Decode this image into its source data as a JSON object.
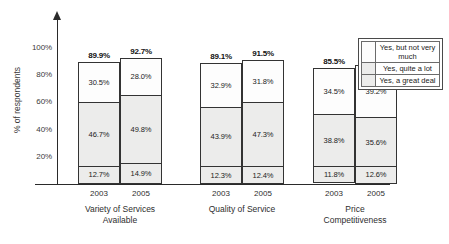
{
  "chart_data": {
    "type": "bar",
    "subtype": "stacked-grouped-column",
    "title": "",
    "xlabel": "",
    "ylabel": "% of respondents",
    "ylim": [
      0,
      100
    ],
    "yticks": [
      "20%",
      "40%",
      "60%",
      "80%",
      "100%"
    ],
    "ytick_values": [
      20,
      40,
      60,
      80,
      100
    ],
    "grid": false,
    "legend_position": "right",
    "legend": [
      {
        "name": "Yes, but not very much",
        "swatch": "#fdfdfd"
      },
      {
        "name": "Yes, quite a lot",
        "swatch": "#ececeb"
      },
      {
        "name": "Yes, a great deal",
        "swatch": "#ececeb"
      }
    ],
    "series": [
      {
        "name": "Yes, but not very much",
        "values": [
          30.5,
          28.0,
          32.9,
          31.8,
          34.5,
          39.2
        ]
      },
      {
        "name": "Yes, quite a lot",
        "values": [
          46.7,
          49.8,
          43.9,
          47.3,
          38.8,
          35.6
        ]
      },
      {
        "name": "Yes, a great deal",
        "values": [
          12.7,
          14.9,
          12.3,
          12.4,
          11.8,
          12.6
        ]
      }
    ],
    "categories": [
      "2003",
      "2005",
      "2003",
      "2005",
      "2003",
      "2005"
    ],
    "groups": [
      {
        "label": "Variety of Services Available",
        "label_line1": "Variety of Services",
        "label_line2": "Available",
        "bars": [
          {
            "year": "2003",
            "total": "89.9%",
            "total_value": 89.9,
            "segments": [
              {
                "label": "30.5%",
                "value": 30.5
              },
              {
                "label": "46.7%",
                "value": 46.7
              },
              {
                "label": "12.7%",
                "value": 12.7
              }
            ]
          },
          {
            "year": "2005",
            "total": "92.7%",
            "total_value": 92.7,
            "segments": [
              {
                "label": "28.0%",
                "value": 28.0
              },
              {
                "label": "49.8%",
                "value": 49.8
              },
              {
                "label": "14.9%",
                "value": 14.9
              }
            ]
          }
        ]
      },
      {
        "label": "Quality of Service",
        "label_line1": "Quality of Service",
        "label_line2": "",
        "bars": [
          {
            "year": "2003",
            "total": "89.1%",
            "total_value": 89.1,
            "segments": [
              {
                "label": "32.9%",
                "value": 32.9
              },
              {
                "label": "43.9%",
                "value": 43.9
              },
              {
                "label": "12.3%",
                "value": 12.3
              }
            ]
          },
          {
            "year": "2005",
            "total": "91.5%",
            "total_value": 91.5,
            "segments": [
              {
                "label": "31.8%",
                "value": 31.8
              },
              {
                "label": "47.3%",
                "value": 47.3
              },
              {
                "label": "12.4%",
                "value": 12.4
              }
            ]
          }
        ]
      },
      {
        "label": "Price Competitiveness",
        "label_line1": "Price",
        "label_line2": "Competitiveness",
        "bars": [
          {
            "year": "2003",
            "total": "85.5%",
            "total_value": 85.5,
            "segments": [
              {
                "label": "34.5%",
                "value": 34.5
              },
              {
                "label": "38.8%",
                "value": 38.8
              },
              {
                "label": "11.8%",
                "value": 11.8
              }
            ]
          },
          {
            "year": "2005",
            "total": "87.4%",
            "total_value": 87.4,
            "segments": [
              {
                "label": "39.2%",
                "value": 39.2
              },
              {
                "label": "35.6%",
                "value": 35.6
              },
              {
                "label": "12.6%",
                "value": 12.6
              }
            ]
          }
        ]
      }
    ]
  }
}
